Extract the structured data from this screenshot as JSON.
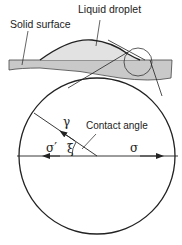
{
  "figure": {
    "labels": {
      "solid_surface": "Solid surface",
      "liquid_droplet": "Liquid droplet",
      "contact_angle": "Contact angle"
    },
    "symbols": {
      "gamma": "γ",
      "sigma": "σ",
      "sigma_prime": "σ′",
      "xi": "ξ"
    },
    "colors": {
      "surface_fill": "#c9c9c9",
      "droplet_fill": "#e2e2e2",
      "stroke": "#222222",
      "background": "#ffffff"
    }
  }
}
